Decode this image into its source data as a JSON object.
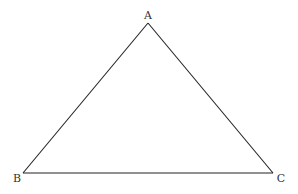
{
  "diagram": {
    "type": "triangle",
    "vertices": [
      {
        "label": "A",
        "x": 148,
        "y": 23,
        "label_x": 148,
        "label_y": 19
      },
      {
        "label": "B",
        "x": 23,
        "y": 173,
        "label_x": 17,
        "label_y": 182
      },
      {
        "label": "C",
        "x": 273,
        "y": 173,
        "label_x": 281,
        "label_y": 182
      }
    ],
    "edges": [
      {
        "from": "A",
        "to": "B"
      },
      {
        "from": "B",
        "to": "C"
      },
      {
        "from": "C",
        "to": "A"
      }
    ],
    "colors": {
      "line": "#222222",
      "label": "#333333",
      "background": "#ffffff"
    }
  }
}
